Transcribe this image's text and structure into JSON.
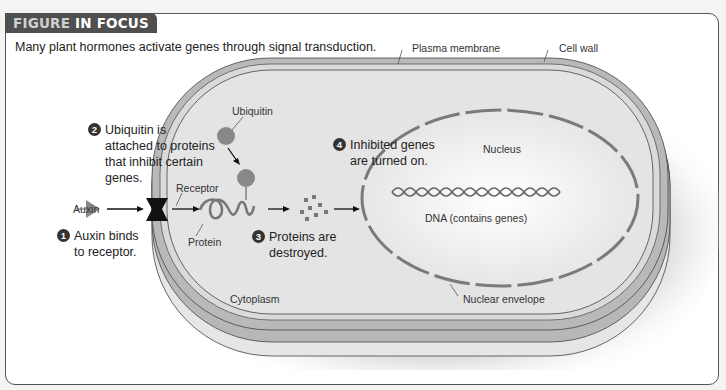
{
  "header": {
    "tag_part1": "FIGURE",
    "tag_part2": "IN FOCUS",
    "caption": "Many plant hormones activate genes through signal transduction."
  },
  "labels": {
    "plasma_membrane": "Plasma membrane",
    "cell_wall": "Cell wall",
    "ubiquitin": "Ubiquitin",
    "receptor": "Receptor",
    "auxin": "Auxin",
    "protein": "Protein",
    "nucleus": "Nucleus",
    "dna": "DNA (contains genes)",
    "cytoplasm": "Cytoplasm",
    "nuclear_envelope": "Nuclear envelope"
  },
  "steps": [
    {
      "number": "1",
      "line1": "Auxin binds",
      "line2": "to receptor."
    },
    {
      "number": "2",
      "line1": "Ubiquitin is",
      "line2": "attached to proteins",
      "line3": "that inhibit certain",
      "line4": "genes."
    },
    {
      "number": "3",
      "line1": "Proteins are",
      "line2": "destroyed."
    },
    {
      "number": "4",
      "line1": "Inhibited genes",
      "line2": "are turned on."
    }
  ],
  "colors": {
    "cell_wall": "#b9b9b9",
    "cytoplasm": "#e2e2e2",
    "nucleus": "#f2f2f2",
    "protein_gray": "#7a7a7a",
    "tag_bg": "#4f4f4f"
  }
}
